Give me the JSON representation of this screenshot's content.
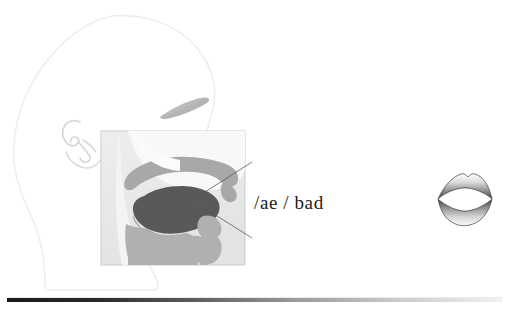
{
  "figure": {
    "type": "articulation-diagram",
    "title_text": "",
    "phoneme_label": "/ae / bad",
    "colors": {
      "background": "#ffffff",
      "head_outline": "#eceef0",
      "ear_outline": "#d9dbdd",
      "eyebrow_fill": "#bfc1c3",
      "inset_box_border": "#c9cbcd",
      "inset_box_fill": "#ececec",
      "airway_fill": "#f7f7f7",
      "palate_fill": "#a8a8a8",
      "tongue_fill": "#595959",
      "jaw_fill": "#b0b0b0",
      "leader_line": "#5a5a5a",
      "label_text": "#1b1b1b",
      "footer_bar_dark": "#1a1a1a",
      "footer_bar_light": "#f2f2f2"
    },
    "parts": {
      "head_profile_name": "head-profile-outline",
      "ear_name": "ear-outline",
      "eyebrow_name": "eyebrow-shape",
      "inset_name": "vocal-tract-inset",
      "palate_name": "hard-palate-region",
      "tongue_name": "tongue-body",
      "jaw_name": "lower-jaw-region",
      "velum_name": "velum-region",
      "epiglottis_name": "epiglottis-region",
      "lips_name": "frontal-lip-shape",
      "footer_name": "footer-gradient-bar"
    },
    "leader_lines": [
      {
        "name": "leader-line-upper",
        "x1": 252,
        "y1": 162,
        "x2": 205,
        "y2": 192
      },
      {
        "name": "leader-line-lower",
        "x1": 252,
        "y1": 238,
        "x2": 198,
        "y2": 204
      }
    ],
    "inset_box": {
      "x": 101,
      "y": 131,
      "width": 144,
      "height": 134
    },
    "lips": {
      "cx": 465,
      "cy": 199,
      "rx": 27,
      "ry": 25
    },
    "footer_bar": {
      "x": 7,
      "y": 298,
      "width": 495,
      "height": 4
    }
  }
}
